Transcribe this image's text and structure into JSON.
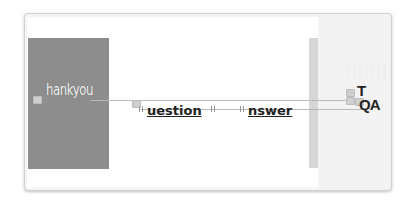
{
  "canvas": {
    "slide_background": "#ffffff",
    "panel_color": "#8d8d8d",
    "sidebar_color": "#d6d6d6",
    "right_area_color": "#f3f3f3"
  },
  "elements": {
    "thankyou": {
      "text": "hankyou",
      "dropcap_hidden": "T"
    },
    "question": {
      "text": "uestion",
      "dropcap_hidden": "Q"
    },
    "answer": {
      "text": "nswer",
      "dropcap_hidden": "A"
    },
    "title_T": {
      "text": "T"
    },
    "title_QA": {
      "text": "QA"
    }
  }
}
